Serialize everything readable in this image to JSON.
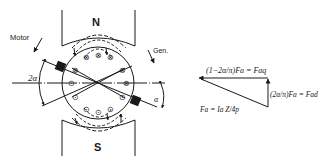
{
  "diagram": {
    "type": "dc-machine-armature-reaction",
    "labels": {
      "north_pole": "N",
      "south_pole": "S",
      "motor": "Motor",
      "generator": "Gen.",
      "brush_shift_angle": "2α",
      "alpha": "α"
    },
    "vector_diagram": {
      "horizontal_label": "(1−2α/π)Fa = Faq",
      "vertical_label": "(2α/π)Fa = Fad",
      "resultant_label": "Fa = Ia Z/4p"
    },
    "conductors": {
      "top_group": [
        "⊗",
        "⊗",
        "⊗"
      ],
      "upper_pair": [
        "⊗",
        "⊗"
      ],
      "mid_left": "⊙",
      "mid_right": "⊗",
      "lower_pair": [
        "⊙",
        "⊙"
      ],
      "bottom_group": [
        "⊙",
        "⊙",
        "⊙"
      ]
    },
    "colors": {
      "ink": "#1a1a1a",
      "background": "#ffffff"
    }
  }
}
